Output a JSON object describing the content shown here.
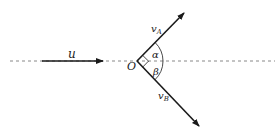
{
  "diagram": {
    "type": "collision-vector-diagram",
    "labels": {
      "incoming_velocity": "u",
      "origin": "O",
      "velocity_a": "v",
      "velocity_a_sub": "A",
      "velocity_b": "v",
      "velocity_b_sub": "B",
      "angle_alpha": "α",
      "angle_beta": "β"
    },
    "colors": {
      "line": "#1a1a1a",
      "dashed_axis": "#888888",
      "text": "#222222"
    },
    "elements": {
      "axis": {
        "style": "dashed",
        "from": [
          10,
          61
        ],
        "to": [
          275,
          61
        ]
      },
      "u_arrow": {
        "from": [
          42,
          61
        ],
        "to": [
          103,
          61
        ]
      },
      "origin_point": [
        137,
        61
      ],
      "va_arrow": {
        "from": [
          137,
          61
        ],
        "to": [
          184,
          13
        ]
      },
      "vb_arrow": {
        "from": [
          137,
          61
        ],
        "to": [
          199,
          126
        ]
      },
      "right_angle_marker": true,
      "angle_arc_radius": 26
    }
  }
}
